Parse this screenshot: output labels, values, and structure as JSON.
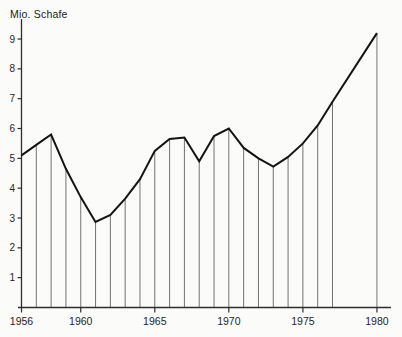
{
  "chart": {
    "colors": {
      "background": "#fbfbf9",
      "curve": "#141414",
      "axis": "#2e2e2e",
      "dropline": "#737373",
      "text": "#262626"
    }
  },
  "chart_data": {
    "type": "line",
    "title": "Mio. Schafe",
    "xlabel": "",
    "ylabel": "Mio. Schafe",
    "x": [
      1956,
      1957,
      1958,
      1959,
      1960,
      1961,
      1962,
      1963,
      1964,
      1965,
      1966,
      1967,
      1968,
      1969,
      1970,
      1971,
      1972,
      1973,
      1974,
      1975,
      1976,
      1977,
      1980
    ],
    "values": [
      5.1,
      5.45,
      5.8,
      4.65,
      3.7,
      2.87,
      3.1,
      3.65,
      4.3,
      5.25,
      5.65,
      5.7,
      4.9,
      5.75,
      6.0,
      5.35,
      5.0,
      4.72,
      5.05,
      5.5,
      6.1,
      6.9,
      9.2
    ],
    "x_tick_labels": [
      1956,
      1960,
      1965,
      1970,
      1975,
      1980
    ],
    "y_tick_labels": [
      1,
      2,
      3,
      4,
      5,
      6,
      7,
      8,
      9
    ],
    "xlim": [
      1956,
      1980
    ],
    "ylim": [
      0,
      9.7
    ],
    "grid": false,
    "legend": false
  }
}
